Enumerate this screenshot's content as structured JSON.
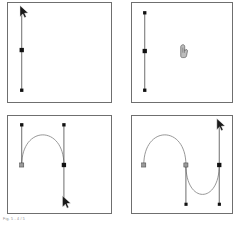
{
  "figure": {
    "caption": "Fig. 5 - 4 / 5",
    "background_color": "#ffffff",
    "panel_border_color": "#6f6f6f",
    "curve_color": "#8a8a8a",
    "handle_line_color": "#5a5a5a",
    "anchor_fill_color": "#111111",
    "anchor_open_fill_color": "#9a9a9a",
    "cursor_color": "#1a1a1a"
  },
  "panels": [
    {
      "id": "panel-1",
      "name": "panel-drag-first-handle",
      "label": "1",
      "cursor": {
        "type": "arrow-cursor",
        "x": 14,
        "y": 6
      },
      "handle_line": {
        "x1": 14,
        "y1": 8,
        "x2": 14,
        "y2": 89
      },
      "anchors": [
        {
          "kind": "square",
          "x": 14,
          "y": 48,
          "filled": true
        },
        {
          "kind": "square",
          "x": 14,
          "y": 89,
          "filled": true
        }
      ],
      "curves": []
    },
    {
      "id": "panel-2",
      "name": "panel-release-first-handle",
      "label": "2",
      "cursor": {
        "type": "pen-cursor",
        "x": 53,
        "y": 47
      },
      "handle_line": {
        "x1": 13,
        "y1": 10,
        "x2": 13,
        "y2": 89
      },
      "anchors": [
        {
          "kind": "square",
          "x": 13,
          "y": 10,
          "filled": true
        },
        {
          "kind": "square",
          "x": 13,
          "y": 49,
          "filled": true
        },
        {
          "kind": "square",
          "x": 13,
          "y": 89,
          "filled": true
        }
      ],
      "curves": []
    },
    {
      "id": "panel-3",
      "name": "panel-arc-segment",
      "label": "3",
      "cursor": {
        "type": "arrow-cursor",
        "x": 58,
        "y": 86
      },
      "handle_lines": [
        {
          "x1": 14,
          "y1": 9,
          "x2": 14,
          "y2": 50
        },
        {
          "x1": 57,
          "y1": 9,
          "x2": 57,
          "y2": 92
        }
      ],
      "anchors": [
        {
          "kind": "square",
          "x": 14,
          "y": 9,
          "filled": true
        },
        {
          "kind": "square",
          "x": 14,
          "y": 50,
          "filled": false
        },
        {
          "kind": "square",
          "x": 57,
          "y": 9,
          "filled": true
        },
        {
          "kind": "square",
          "x": 57,
          "y": 50,
          "filled": true
        }
      ],
      "curves": [
        {
          "d": "M 14,50 C 14,9 57,9 57,50"
        }
      ]
    },
    {
      "id": "panel-4",
      "name": "panel-s-curve-segment",
      "label": "4",
      "cursor": {
        "type": "arrow-cursor",
        "x": 88,
        "y": 6
      },
      "handle_lines": [
        {
          "x1": 55,
          "y1": 50,
          "x2": 55,
          "y2": 90
        },
        {
          "x1": 89,
          "y1": 8,
          "x2": 89,
          "y2": 90
        }
      ],
      "anchors": [
        {
          "kind": "square",
          "x": 12,
          "y": 50,
          "filled": false
        },
        {
          "kind": "square",
          "x": 55,
          "y": 50,
          "filled": false
        },
        {
          "kind": "square",
          "x": 55,
          "y": 90,
          "filled": true
        },
        {
          "kind": "square",
          "x": 89,
          "y": 50,
          "filled": true
        },
        {
          "kind": "square",
          "x": 89,
          "y": 90,
          "filled": true
        }
      ],
      "curves": [
        {
          "d": "M 12,50 C 12,9 55,9 55,50"
        },
        {
          "d": "M 55,50 C 55,90 89,90 89,50"
        }
      ]
    }
  ]
}
